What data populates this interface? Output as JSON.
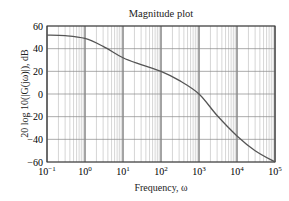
{
  "chart_data": {
    "type": "line",
    "title": "Magnitude plot",
    "xlabel": "Frequency, ω",
    "ylabel": "20 log 10(|G(jω)|), dB",
    "xscale": "log",
    "xlim": [
      0.1,
      100000
    ],
    "ylim": [
      -60,
      60
    ],
    "grid": true,
    "x_ticks": [
      "10^-1",
      "10^0",
      "10^1",
      "10^2",
      "10^3",
      "10^4",
      "10^5"
    ],
    "y_ticks": [
      60,
      40,
      20,
      0,
      -20,
      -40,
      -60
    ],
    "series": [
      {
        "name": "magnitude",
        "x": [
          0.1,
          0.3,
          1,
          3,
          10,
          30,
          100,
          300,
          1000,
          3000,
          10000,
          30000,
          100000
        ],
        "values": [
          52,
          51.5,
          49,
          42,
          32,
          26,
          20,
          12,
          0,
          -19,
          -37,
          -50,
          -60
        ]
      }
    ]
  },
  "labels": {
    "title": "Magnitude plot",
    "xlabel": "Frequency, ω",
    "ylabel": "20 log 10(|G(jω)|), dB"
  }
}
